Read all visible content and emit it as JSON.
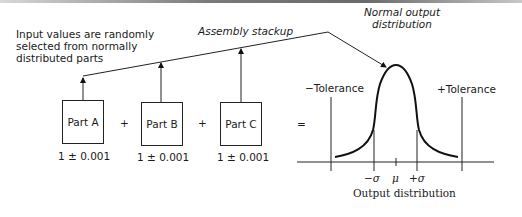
{
  "annotations": {
    "inputs_note": [
      "Input values are randomly",
      "selected from normally",
      "distributed parts"
    ],
    "assembly": "Assembly stackup",
    "normal_output": [
      "Normal output",
      "distribution"
    ]
  },
  "parts": [
    {
      "label": "Part A",
      "value": "1 ± 0.001"
    },
    {
      "label": "Part B",
      "value": "1 ± 0.001"
    },
    {
      "label": "Part C",
      "value": "1 ± 0.001"
    }
  ],
  "operators": {
    "plus": "+",
    "equals": "="
  },
  "distribution": {
    "minus_tol": "−Tolerance",
    "plus_tol": "+Tolerance",
    "minus_sigma": "−σ",
    "mu": "μ",
    "plus_sigma": "+σ",
    "caption": "Output distribution"
  }
}
